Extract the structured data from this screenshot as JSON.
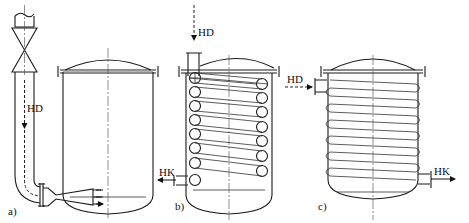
{
  "figure": {
    "panels": [
      {
        "id": "a",
        "caption": "a)",
        "description": "Direct steam injection through nozzle",
        "inlet_label": "HD"
      },
      {
        "id": "b",
        "caption": "b)",
        "description": "Internal heating coil",
        "inlet_label": "HD",
        "outlet_label": "HK"
      },
      {
        "id": "c",
        "caption": "c)",
        "description": "External heating coil",
        "inlet_label": "HD",
        "outlet_label": "HK"
      }
    ]
  }
}
